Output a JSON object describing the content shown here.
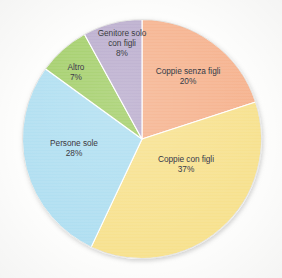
{
  "chart_data": {
    "type": "pie",
    "title": "",
    "subtitle": "",
    "xlabel": "",
    "ylabel": "",
    "legend_position": "none",
    "grid": false,
    "labels_inside_slices": true,
    "start_angle_deg": 0,
    "direction": "clockwise",
    "categories": [
      "Coppie senza figli",
      "Coppie con figli",
      "Persone sole",
      "Altro",
      "Genitore solo con figli"
    ],
    "values": [
      20,
      37,
      28,
      7,
      8
    ],
    "value_suffix": "%",
    "colors": [
      "#F5AF89",
      "#F7E08A",
      "#ACDDF0",
      "#9FCC64",
      "#B7A9CB"
    ],
    "slices": [
      {
        "name": "Coppie senza figli",
        "label_lines": [
          "Coppie senza figli"
        ],
        "value": 20,
        "value_text": "20%",
        "color": "#F5AF89",
        "start_deg": 0,
        "end_deg": 72
      },
      {
        "name": "Coppie con figli",
        "label_lines": [
          "Coppie con figli"
        ],
        "value": 37,
        "value_text": "37%",
        "color": "#F7E08A",
        "start_deg": 72,
        "end_deg": 205.2
      },
      {
        "name": "Persone sole",
        "label_lines": [
          "Persone sole"
        ],
        "value": 28,
        "value_text": "28%",
        "color": "#ACDDF0",
        "start_deg": 205.2,
        "end_deg": 306
      },
      {
        "name": "Altro",
        "label_lines": [
          "Altro"
        ],
        "value": 7,
        "value_text": "7%",
        "color": "#9FCC64",
        "start_deg": 306,
        "end_deg": 331.2
      },
      {
        "name": "Genitore solo con figli",
        "label_lines": [
          "Genitore solo",
          "con figli"
        ],
        "value": 8,
        "value_text": "8%",
        "color": "#B7A9CB",
        "start_deg": 331.2,
        "end_deg": 360
      }
    ]
  },
  "style": {
    "background": "#fdfdfc",
    "slice_outline": "#ffffff",
    "label_text_color": "#2c2c33"
  }
}
